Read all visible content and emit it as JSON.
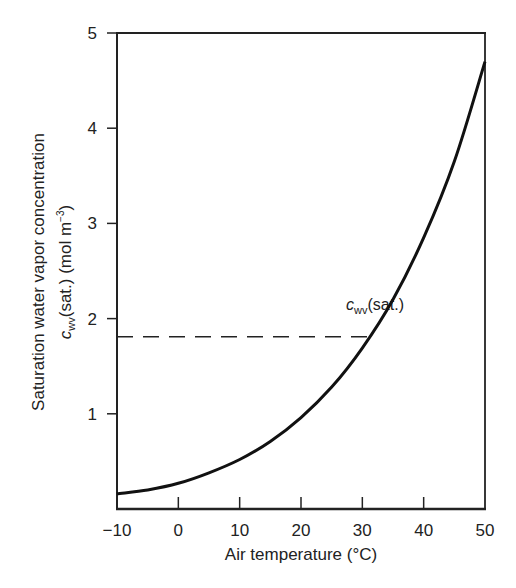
{
  "chart_data": {
    "type": "line",
    "title": "",
    "xlabel": "Air temperature (°C)",
    "ylabel_line1": "Saturation water vapor concentration",
    "ylabel_line2": {
      "symbol": "c",
      "subscript": "wv",
      "rest": "(sat.) (mol m",
      "superscript": "−3",
      "close": ")"
    },
    "xlim": [
      -10,
      50
    ],
    "ylim": [
      0,
      5
    ],
    "x_ticks": [
      -10,
      0,
      10,
      20,
      30,
      40,
      50
    ],
    "x_tick_labels": [
      "−10",
      "0",
      "10",
      "20",
      "30",
      "40",
      "50"
    ],
    "y_ticks": [
      1,
      2,
      3,
      4,
      5
    ],
    "y_tick_labels": [
      "1",
      "2",
      "3",
      "4",
      "5"
    ],
    "grid": false,
    "legend": "none",
    "series": [
      {
        "name": "cwv(sat.)",
        "x": [
          -10,
          -5,
          0,
          5,
          10,
          15,
          20,
          25,
          30,
          35,
          40,
          45,
          50
        ],
        "values": [
          0.16,
          0.2,
          0.27,
          0.38,
          0.52,
          0.71,
          0.96,
          1.28,
          1.69,
          2.2,
          2.85,
          3.65,
          4.7
        ]
      }
    ],
    "annotations": [
      {
        "type": "curve-label",
        "symbol": "c",
        "subscript": "wv",
        "rest": "(sat.)",
        "x": 28,
        "y": 2.15
      },
      {
        "type": "dashed-hline",
        "y": 1.81,
        "x_from": -10,
        "x_to": 31.3
      }
    ]
  },
  "colors": {
    "line": "#111111",
    "axis": "#222222",
    "text": "#222222",
    "background": "#ffffff"
  }
}
